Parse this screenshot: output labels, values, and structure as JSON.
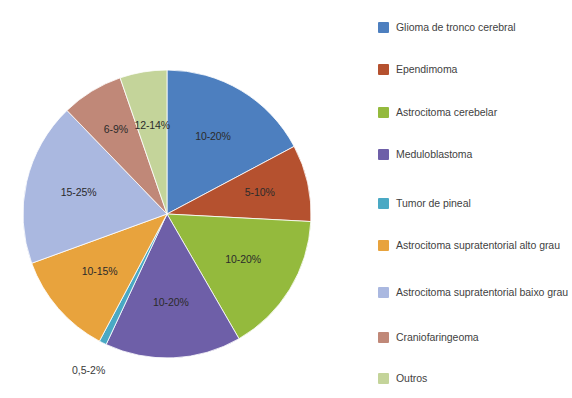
{
  "chart_data": {
    "type": "pie",
    "title": "",
    "subtitle": "",
    "xlabel": "",
    "ylabel": "",
    "legend_position": "right",
    "grid": false,
    "center": [
      167,
      214
    ],
    "radius": 144,
    "start_angle_deg": 0,
    "direction": "clockwise",
    "categories": [
      "Glioma de tronco cerebral",
      "Ependimoma",
      "Astrocitoma cerebelar",
      "Meduloblastoma",
      "Tumor de pineal",
      "Astrocitoma supratentorial alto grau",
      "Astrocitoma supratentorial baixo grau",
      "Craniofaringeoma",
      "Outros"
    ],
    "values": [
      62,
      31,
      57,
      55,
      3,
      42,
      66,
      25,
      39
    ],
    "value_unit": "degrees",
    "data_labels": [
      "10-20%",
      "5-10%",
      "10-20%",
      "10-20%",
      "0,5-2%",
      "10-15%",
      "15-25%",
      "6-9%",
      "12-14%"
    ],
    "colors": [
      "#4d7fbf",
      "#b5512f",
      "#94ba3d",
      "#6e5fa8",
      "#4aa9c4",
      "#e8a33d",
      "#aab8e0",
      "#c08878",
      "#c4d49a"
    ],
    "slices": [
      {
        "name": "Glioma de tronco cerebral",
        "label": "10-20%",
        "color": "#4d7fbf",
        "start_deg": 0,
        "end_deg": 62,
        "label_radius": 0.62,
        "label_outside": false
      },
      {
        "name": "Ependimoma",
        "label": "5-10%",
        "color": "#b5512f",
        "start_deg": 62,
        "end_deg": 93,
        "label_radius": 0.66,
        "label_outside": false
      },
      {
        "name": "Astrocitoma cerebelar",
        "label": "10-20%",
        "color": "#94ba3d",
        "start_deg": 93,
        "end_deg": 150,
        "label_radius": 0.62,
        "label_outside": false
      },
      {
        "name": "Meduloblastoma",
        "label": "10-20%",
        "color": "#6e5fa8",
        "start_deg": 150,
        "end_deg": 205,
        "label_radius": 0.62,
        "label_outside": false
      },
      {
        "name": "Tumor de pineal",
        "label": "0,5-2%",
        "color": "#4aa9c4",
        "start_deg": 205,
        "end_deg": 208,
        "label_radius": 1.22,
        "label_outside": true
      },
      {
        "name": "Astrocitoma supratentorial alto grau",
        "label": "10-15%",
        "color": "#e8a33d",
        "start_deg": 208,
        "end_deg": 250,
        "label_radius": 0.62,
        "label_outside": false
      },
      {
        "name": "Astrocitoma supratentorial baixo grau",
        "label": "15-25%",
        "color": "#aab8e0",
        "start_deg": 250,
        "end_deg": 316,
        "label_radius": 0.63,
        "label_outside": false
      },
      {
        "name": "Craniofaringeoma",
        "label": "6-9%",
        "color": "#c08878",
        "start_deg": 316,
        "end_deg": 341,
        "label_radius": 0.68,
        "label_outside": false
      },
      {
        "name": "Outros",
        "label": "12-14%",
        "color": "#c4d49a",
        "start_deg": 341,
        "end_deg": 360,
        "end_deg_wrapped": 360,
        "label_radius": 0.62,
        "label_outside": false
      }
    ]
  },
  "legend": {
    "items": [
      {
        "label": "Glioma de tronco cerebral",
        "color": "#4d7fbf",
        "y": 20
      },
      {
        "label": "Ependimoma",
        "color": "#b5512f",
        "y": 62
      },
      {
        "label": "Astrocitoma cerebelar",
        "color": "#94ba3d",
        "y": 105
      },
      {
        "label": "Meduloblastoma",
        "color": "#6e5fa8",
        "y": 147
      },
      {
        "label": "Tumor de pineal",
        "color": "#4aa9c4",
        "y": 196
      },
      {
        "label": "Astrocitoma supratentorial alto grau",
        "color": "#e8a33d",
        "y": 238
      },
      {
        "label": "Astrocitoma supratentorial baixo grau",
        "color": "#aab8e0",
        "y": 285
      },
      {
        "label": "Craniofaringeoma",
        "color": "#c08878",
        "y": 330
      },
      {
        "label": "Outros",
        "color": "#c4d49a",
        "y": 371
      }
    ]
  }
}
